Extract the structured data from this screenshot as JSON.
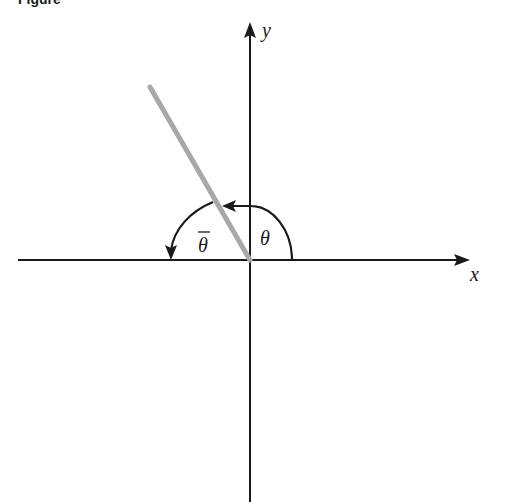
{
  "figure": {
    "caption_partial": "Figure",
    "axes": {
      "x_label": "x",
      "y_label": "y"
    },
    "angles": {
      "theta_label": "θ",
      "theta_bar_label": "θ",
      "theta_bar_overbar": true
    },
    "ray": {
      "angle_deg": 120,
      "color": "#a8a8a8"
    },
    "colors": {
      "axis": "#1a1a1a",
      "arc": "#1a1a1a",
      "ray": "#a8a8a8",
      "background": "#ffffff"
    }
  }
}
